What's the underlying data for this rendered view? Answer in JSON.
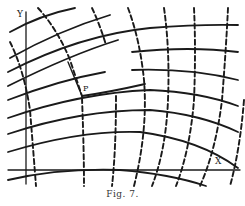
{
  "figure": {
    "caption": "Fig. 7.",
    "axis_x_label": "X",
    "axis_y_label": "Y",
    "point_label": "P",
    "ink_color": "#1a1a1a",
    "background": "#ffffff"
  },
  "description": {
    "solid_curves": "Family of solid curves arcing from left to right, concave downward",
    "dashed_curves": "Family of dashed curves running roughly vertically, crossing the solid curves",
    "point": "Point P where a solid curve meets a dashed curve corner near the middle-left"
  }
}
